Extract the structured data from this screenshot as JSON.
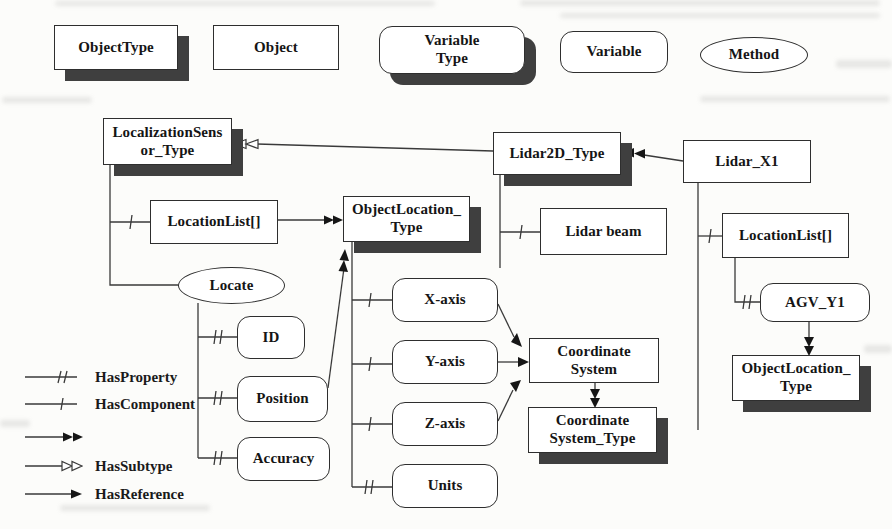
{
  "palette": {
    "object_type": "ObjectType",
    "object": "Object",
    "variable_type": "Variable\nType",
    "variable": "Variable",
    "method": "Method"
  },
  "nodes": {
    "localization_sensor_type": "LocalizationSens\nor_Type",
    "lidar2d_type": "Lidar2D_Type",
    "lidar_x1": "Lidar_X1",
    "location_list_left": "LocationList[]",
    "object_location_type": "ObjectLocation_\nType",
    "lidar_beam": "Lidar beam",
    "location_list_right": "LocationList[]",
    "locate": "Locate",
    "id": "ID",
    "position": "Position",
    "accuracy": "Accuracy",
    "x_axis": "X-axis",
    "y_axis": "Y-axis",
    "z_axis": "Z-axis",
    "units": "Units",
    "coordinate_system": "Coordinate\nSystem",
    "coordinate_system_type": "Coordinate\nSystem_Type",
    "agv_y1": "AGV_Y1",
    "object_location_type_instance": "ObjectLocation_\nType"
  },
  "edge_legend": {
    "has_property": "HasProperty",
    "has_component": "HasComponent",
    "has_type_definition": "",
    "has_subtype": "HasSubtype",
    "has_reference": "HasReference"
  }
}
